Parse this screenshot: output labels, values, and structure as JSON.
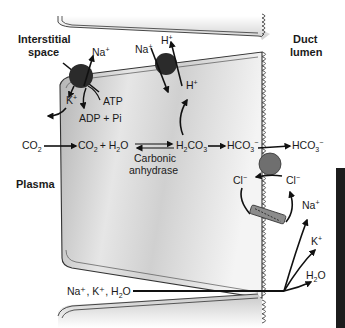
{
  "labels": {
    "interstitial": [
      "Interstitial",
      "space"
    ],
    "duct": [
      "Duct",
      "lumen"
    ],
    "plasma": "Plasma"
  },
  "pump_naK": {
    "na": "Na",
    "na_sup": "+",
    "k": "K",
    "k_sup": "+",
    "atp": "ATP",
    "adp": "ADP + Pi"
  },
  "pump_naH": {
    "na": "Na",
    "na_sup": "+",
    "h_out": "H",
    "h_sup": "+",
    "h_in": "H",
    "h_in_sup": "+"
  },
  "reaction": {
    "co2_plasma": "CO",
    "co2_sub": "2",
    "co2_cell": "CO",
    "co2_cell_sub": "2",
    "plus_h2o": "+ H",
    "h2o_sub": "2",
    "h2o_o": "O",
    "enzyme": [
      "Carbonic",
      "anhydrase"
    ],
    "h2co3": "H",
    "h2co3_sub1": "2",
    "h2co3_mid": "CO",
    "h2co3_sub2": "3",
    "hco3_cell": "HCO",
    "hco3_sub": "3",
    "hco3_sup": "−",
    "hco3_lumen": "HCO",
    "hco3_lumen_sub": "3",
    "hco3_lumen_sup": "−"
  },
  "chloride": {
    "cl_in": "Cl",
    "cl_in_sup": "−",
    "cl_out": "Cl",
    "cl_out_sup": "−"
  },
  "paracellular": {
    "source": "Na⁺, K⁺, H",
    "source_sub": "2",
    "source_o": "O",
    "na": "Na",
    "na_sup": "+",
    "k": "K",
    "k_sup": "+",
    "h2o": "H",
    "h2o_sub": "2",
    "h2o_o": "O"
  },
  "colors": {
    "cell_fill_dark": "#a9a9a9",
    "cell_fill_light": "#f2f2f2",
    "pump": "#2b2b2b",
    "exchanger": "#6f6f6f",
    "channel": "#8c8c8c",
    "ink": "#111111",
    "side_bar": "#1c1c1c"
  }
}
